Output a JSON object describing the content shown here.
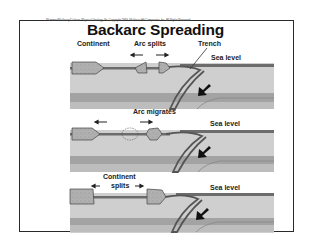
{
  "slide": {
    "copyright": "Plummer/McGeary/Carlson: Physical Geology, 8e. Copyright 1999, McGraw-Hill Companies, Inc. All Rights Reserved",
    "title": "Backarc Spreading"
  },
  "panels": [
    {
      "labels": {
        "continent": "Continent",
        "arc_splits": "Arc splits",
        "trench": "Trench",
        "sea_level": "Sea level"
      }
    },
    {
      "labels": {
        "arc_migrates": "Arc migrates",
        "sea_level": "Sea level"
      }
    },
    {
      "labels": {
        "continent_splits_line1": "Continent",
        "continent_splits_line2": "splits",
        "sea_level": "Sea level"
      }
    }
  ],
  "colors": {
    "mantle": "#c9c9c9",
    "deep_layer": "#9f9f9f",
    "crust": "#7a7a7a",
    "continent": "#b4b4b4",
    "outline": "#333333"
  }
}
